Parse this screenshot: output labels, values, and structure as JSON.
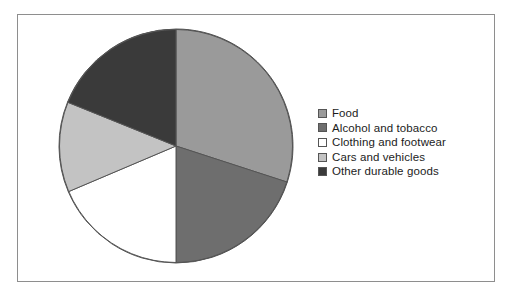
{
  "chart_data": {
    "type": "pie",
    "title": "",
    "categories": [
      "Food",
      "Alcohol and tobacco",
      "Clothing and footwear",
      "Cars and vehicles",
      "Other durable goods"
    ],
    "values": [
      30.0,
      20.0,
      18.6,
      12.5,
      18.9
    ],
    "units": "percent",
    "angles_deg": [
      108,
      72,
      67,
      45,
      68
    ],
    "start_angle_deg": 0,
    "direction": "clockwise",
    "colors": [
      "#9a9a9a",
      "#6e6e6e",
      "#ffffff",
      "#c3c3c3",
      "#3a3a3a"
    ],
    "legend_position": "right",
    "grid": false,
    "xlabel": "",
    "ylabel": ""
  },
  "legend": {
    "items": [
      {
        "label": "Food",
        "color": "#9a9a9a"
      },
      {
        "label": "Alcohol and tobacco",
        "color": "#6e6e6e"
      },
      {
        "label": "Clothing and footwear",
        "color": "#ffffff"
      },
      {
        "label": "Cars and vehicles",
        "color": "#c3c3c3"
      },
      {
        "label": "Other durable goods",
        "color": "#3a3a3a"
      }
    ]
  },
  "frame": {
    "border_color": "#8e8e8e",
    "background": "#ffffff"
  },
  "pie": {
    "outline_color": "#555555",
    "center_x": 118,
    "center_y": 118,
    "radius": 117
  }
}
